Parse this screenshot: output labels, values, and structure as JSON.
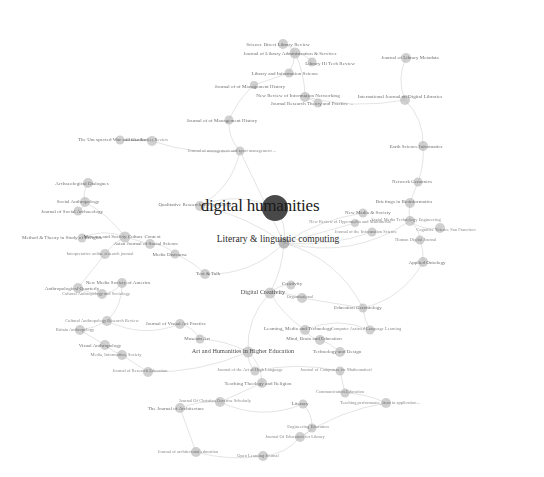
{
  "figure": {
    "title": "digital humanities",
    "type": "network-graph",
    "background_color": "#ffffff",
    "node_color": "#b4b4b4",
    "hub_color": "#3a3a3a",
    "edge_color": "#bdbdbd",
    "label_color": "#555555"
  },
  "chart_data": {
    "type": "scatter",
    "title": "digital humanities",
    "xlabel": "",
    "ylabel": "",
    "grid": false,
    "legend": "none",
    "nodes": [
      {
        "id": "digital-humanities",
        "label": "digital humanities",
        "x": 275,
        "y": 208,
        "r": 13,
        "tier": "hub",
        "size": "hub-label",
        "lx": 260,
        "ly": 205
      },
      {
        "id": "literary-linguistic-computing",
        "label": "Literary & linguistic computing",
        "x": 284,
        "y": 243,
        "r": 5.5,
        "tier": "mid",
        "size": "large",
        "lx": 278,
        "ly": 240
      },
      {
        "id": "n-001",
        "label": "Science Direct Library Review",
        "x": 283,
        "y": 44,
        "r": 5,
        "tier": "",
        "size": "small",
        "lx": 278,
        "ly": 44
      },
      {
        "id": "n-002",
        "label": "Journal of Library Administration & Services",
        "x": 295,
        "y": 53,
        "r": 5.5,
        "tier": "",
        "size": "small",
        "lx": 290,
        "ly": 53
      },
      {
        "id": "n-003",
        "label": "Library Hi Tech Review",
        "x": 312,
        "y": 62,
        "r": 4.5,
        "tier": "",
        "size": "small",
        "lx": 330,
        "ly": 63
      },
      {
        "id": "n-004",
        "label": "Library and Information Science",
        "x": 289,
        "y": 73,
        "r": 4.5,
        "tier": "",
        "size": "small",
        "lx": 285,
        "ly": 73
      },
      {
        "id": "n-005",
        "label": "Journal of of Management History",
        "x": 254,
        "y": 85,
        "r": 4,
        "tier": "",
        "size": "small",
        "lx": 250,
        "ly": 86
      },
      {
        "id": "n-006",
        "label": "New Review of Information Networking",
        "x": 305,
        "y": 97,
        "r": 5,
        "tier": "",
        "size": "small",
        "lx": 298,
        "ly": 95
      },
      {
        "id": "n-007",
        "label": "Journal Research Theory and Practice ...",
        "x": 318,
        "y": 103,
        "r": 4.5,
        "tier": "",
        "size": "small",
        "lx": 312,
        "ly": 103
      },
      {
        "id": "n-008",
        "label": "International Journal on Digital Libraries",
        "x": 405,
        "y": 100,
        "r": 5,
        "tier": "",
        "size": "small",
        "lx": 400,
        "ly": 96
      },
      {
        "id": "n-009",
        "label": "Journal of Library Metadata",
        "x": 406,
        "y": 58,
        "r": 5,
        "tier": "",
        "size": "small",
        "lx": 410,
        "ly": 57
      },
      {
        "id": "n-010",
        "label": "Journal of of Management History",
        "x": 229,
        "y": 120,
        "r": 4.5,
        "tier": "",
        "size": "small",
        "lx": 222,
        "ly": 120
      },
      {
        "id": "n-011",
        "label": "Journal of management and sport management ...",
        "x": 240,
        "y": 151,
        "r": 4.5,
        "tier": "",
        "size": "tiny",
        "lx": 232,
        "ly": 151
      },
      {
        "id": "n-012",
        "label": "The Unexpected War and Gender",
        "x": 120,
        "y": 140,
        "r": 4.5,
        "tier": "",
        "size": "small",
        "lx": 112,
        "ly": 139
      },
      {
        "id": "n-013",
        "label": "Gender Studies Review",
        "x": 152,
        "y": 141,
        "r": 5,
        "tier": "",
        "size": "tiny",
        "lx": 147,
        "ly": 140
      },
      {
        "id": "n-014",
        "label": "Earth Science Informatics",
        "x": 423,
        "y": 146,
        "r": 5,
        "tier": "",
        "size": "small",
        "lx": 416,
        "ly": 146
      },
      {
        "id": "n-015",
        "label": "Network Genomics",
        "x": 418,
        "y": 182,
        "r": 4.5,
        "tier": "",
        "size": "small",
        "lx": 412,
        "ly": 181
      },
      {
        "id": "n-016",
        "label": "Briefings in Bioinformatics",
        "x": 410,
        "y": 203,
        "r": 5,
        "tier": "",
        "size": "small",
        "lx": 404,
        "ly": 201
      },
      {
        "id": "n-017",
        "label": "Archaeological Dialogues",
        "x": 88,
        "y": 183,
        "r": 5,
        "tier": "",
        "size": "small",
        "lx": 82,
        "ly": 183
      },
      {
        "id": "n-018",
        "label": "Social Anthropology",
        "x": 85,
        "y": 202,
        "r": 5,
        "tier": "",
        "size": "small",
        "lx": 78,
        "ly": 201
      },
      {
        "id": "n-019",
        "label": "Journal of Social Archaeology",
        "x": 78,
        "y": 211,
        "r": 4.5,
        "tier": "",
        "size": "small",
        "lx": 72,
        "ly": 211
      },
      {
        "id": "n-020",
        "label": "Qualitative Research in Psychology",
        "x": 200,
        "y": 206,
        "r": 5,
        "tier": "",
        "size": "small",
        "lx": 195,
        "ly": 204
      },
      {
        "id": "n-021",
        "label": "New Media & Society",
        "x": 363,
        "y": 213,
        "r": 4.5,
        "tier": "",
        "size": "small",
        "lx": 368,
        "ly": 212
      },
      {
        "id": "n-022",
        "label": "New Review of Hypermedia and Multimedia",
        "x": 355,
        "y": 223,
        "r": 4,
        "tier": "",
        "size": "tiny",
        "lx": 350,
        "ly": 222
      },
      {
        "id": "n-023",
        "label": "Journal of the Information Science",
        "x": 372,
        "y": 232,
        "r": 4.5,
        "tier": "",
        "size": "tiny",
        "lx": 366,
        "ly": 232
      },
      {
        "id": "n-024",
        "label": "Social Media Technology Engineering",
        "x": 410,
        "y": 221,
        "r": 5,
        "tier": "",
        "size": "tiny",
        "lx": 406,
        "ly": 220
      },
      {
        "id": "n-025",
        "label": "Cognitive Science San Francisco",
        "x": 440,
        "y": 228,
        "r": 5,
        "tier": "",
        "size": "tiny",
        "lx": 446,
        "ly": 230
      },
      {
        "id": "n-026",
        "label": "Human Digital Journal",
        "x": 420,
        "y": 240,
        "r": 4.5,
        "tier": "",
        "size": "tiny",
        "lx": 416,
        "ly": 240
      },
      {
        "id": "n-027",
        "label": "Applied Ontology",
        "x": 423,
        "y": 262,
        "r": 5,
        "tier": "",
        "size": "small",
        "lx": 427,
        "ly": 262
      },
      {
        "id": "n-028",
        "label": "Method & Theory in Study of Religion",
        "x": 82,
        "y": 238,
        "r": 4.5,
        "tier": "",
        "size": "small",
        "lx": 62,
        "ly": 237
      },
      {
        "id": "n-029",
        "label": "Museum and Society Culture Context",
        "x": 125,
        "y": 237,
        "r": 5.5,
        "tier": "",
        "size": "small",
        "lx": 122,
        "ly": 236
      },
      {
        "id": "n-030",
        "label": "Asian Journal of Social Science",
        "x": 150,
        "y": 244,
        "r": 5,
        "tier": "",
        "size": "small",
        "lx": 146,
        "ly": 243
      },
      {
        "id": "n-031",
        "label": "Interpretative online research journal",
        "x": 105,
        "y": 254,
        "r": 5,
        "tier": "",
        "size": "tiny",
        "lx": 100,
        "ly": 254
      },
      {
        "id": "n-032",
        "label": "Media Discourse",
        "x": 175,
        "y": 254,
        "r": 4.5,
        "tier": "",
        "size": "small",
        "lx": 170,
        "ly": 254
      },
      {
        "id": "n-033",
        "label": "Text & Talk",
        "x": 205,
        "y": 274,
        "r": 5,
        "tier": "",
        "size": "small",
        "lx": 208,
        "ly": 273
      },
      {
        "id": "n-034",
        "label": "New Media Society of America",
        "x": 122,
        "y": 283,
        "r": 5,
        "tier": "",
        "size": "small",
        "lx": 118,
        "ly": 282
      },
      {
        "id": "n-035",
        "label": "Anthropological Quarterly",
        "x": 78,
        "y": 288,
        "r": 5,
        "tier": "",
        "size": "small",
        "lx": 72,
        "ly": 288
      },
      {
        "id": "n-036",
        "label": "Cultural Anthropology and Sociology",
        "x": 102,
        "y": 294,
        "r": 5,
        "tier": "",
        "size": "tiny",
        "lx": 96,
        "ly": 294
      },
      {
        "id": "n-037",
        "label": "Digital Creativity",
        "x": 270,
        "y": 293,
        "r": 5.5,
        "tier": "",
        "size": "medium",
        "lx": 263,
        "ly": 292
      },
      {
        "id": "n-038",
        "label": "Creativity",
        "x": 291,
        "y": 285,
        "r": 4.5,
        "tier": "",
        "size": "small",
        "lx": 292,
        "ly": 283
      },
      {
        "id": "n-039",
        "label": "Organisational",
        "x": 302,
        "y": 298,
        "r": 5,
        "tier": "",
        "size": "tiny",
        "lx": 300,
        "ly": 297
      },
      {
        "id": "n-040",
        "label": "Education Gerontology",
        "x": 363,
        "y": 308,
        "r": 4.5,
        "tier": "",
        "size": "small",
        "lx": 358,
        "ly": 307
      },
      {
        "id": "n-041",
        "label": "Cultural Anthropology Research Review",
        "x": 107,
        "y": 321,
        "r": 5,
        "tier": "",
        "size": "tiny",
        "lx": 102,
        "ly": 321
      },
      {
        "id": "n-042",
        "label": "Journal of Visual Art Practice",
        "x": 180,
        "y": 324,
        "r": 5,
        "tier": "",
        "size": "small",
        "lx": 176,
        "ly": 323
      },
      {
        "id": "n-043",
        "label": "Britain Anthropology",
        "x": 80,
        "y": 330,
        "r": 5,
        "tier": "",
        "size": "tiny",
        "lx": 75,
        "ly": 330
      },
      {
        "id": "n-044",
        "label": "Visual Anthropology",
        "x": 105,
        "y": 345,
        "r": 5,
        "tier": "",
        "size": "small",
        "lx": 100,
        "ly": 345
      },
      {
        "id": "n-045",
        "label": "Museum Art",
        "x": 200,
        "y": 339,
        "r": 4.5,
        "tier": "",
        "size": "small",
        "lx": 197,
        "ly": 338
      },
      {
        "id": "n-046",
        "label": "Learning, Media and Technology",
        "x": 305,
        "y": 330,
        "r": 5,
        "tier": "",
        "size": "small",
        "lx": 298,
        "ly": 328
      },
      {
        "id": "n-047",
        "label": "Computer Assisted Language Learning",
        "x": 370,
        "y": 330,
        "r": 4.5,
        "tier": "",
        "size": "tiny",
        "lx": 366,
        "ly": 329
      },
      {
        "id": "n-048",
        "label": "Mind, Brain and Education",
        "x": 320,
        "y": 340,
        "r": 5,
        "tier": "",
        "size": "small",
        "lx": 314,
        "ly": 338
      },
      {
        "id": "n-049",
        "label": "Media, Information, Society",
        "x": 122,
        "y": 355,
        "r": 5,
        "tier": "",
        "size": "tiny",
        "lx": 116,
        "ly": 355
      },
      {
        "id": "n-050",
        "label": "Art and Humanities in Higher Education",
        "x": 248,
        "y": 352,
        "r": 5.5,
        "tier": "",
        "size": "medium",
        "lx": 243,
        "ly": 351
      },
      {
        "id": "n-051",
        "label": "Technology and Design",
        "x": 340,
        "y": 352,
        "r": 5,
        "tier": "",
        "size": "small",
        "lx": 337,
        "ly": 351
      },
      {
        "id": "n-052",
        "label": "Journal of Research Education",
        "x": 148,
        "y": 372,
        "r": 5,
        "tier": "",
        "size": "tiny",
        "lx": 140,
        "ly": 371
      },
      {
        "id": "n-053",
        "label": "Journal of the Art of High Language",
        "x": 255,
        "y": 371,
        "r": 4.5,
        "tier": "",
        "size": "tiny",
        "lx": 250,
        "ly": 370
      },
      {
        "id": "n-054",
        "label": "Journal of Computers for Mathematical",
        "x": 340,
        "y": 371,
        "r": 4.5,
        "tier": "",
        "size": "tiny",
        "lx": 336,
        "ly": 370
      },
      {
        "id": "n-055",
        "label": "Teaching Theology and Religion",
        "x": 262,
        "y": 383,
        "r": 5,
        "tier": "",
        "size": "small",
        "lx": 258,
        "ly": 383
      },
      {
        "id": "n-056",
        "label": "Communication Education",
        "x": 345,
        "y": 393,
        "r": 4.5,
        "tier": "",
        "size": "tiny",
        "lx": 340,
        "ly": 392
      },
      {
        "id": "n-057",
        "label": "Journal Of Christian Doctrine Scholarly",
        "x": 220,
        "y": 402,
        "r": 5,
        "tier": "",
        "size": "tiny",
        "lx": 215,
        "ly": 401
      },
      {
        "id": "n-058",
        "label": "The Journal of Architecture",
        "x": 180,
        "y": 408,
        "r": 5,
        "tier": "",
        "size": "small",
        "lx": 176,
        "ly": 408
      },
      {
        "id": "n-059",
        "label": "Literacy",
        "x": 303,
        "y": 404,
        "r": 4.5,
        "tier": "",
        "size": "small",
        "lx": 300,
        "ly": 403
      },
      {
        "id": "n-060",
        "label": "Teaching performance, trust in application...",
        "x": 386,
        "y": 403,
        "r": 5,
        "tier": "",
        "size": "tiny",
        "lx": 380,
        "ly": 403
      },
      {
        "id": "n-061",
        "label": "Engineering Education",
        "x": 312,
        "y": 428,
        "r": 4.5,
        "tier": "",
        "size": "tiny",
        "lx": 308,
        "ly": 427
      },
      {
        "id": "n-062",
        "label": "Journal Of Education for Library",
        "x": 300,
        "y": 437,
        "r": 5,
        "tier": "",
        "size": "tiny",
        "lx": 295,
        "ly": 437
      },
      {
        "id": "n-063",
        "label": "Journal of architectural education",
        "x": 196,
        "y": 452,
        "r": 5,
        "tier": "",
        "size": "tiny",
        "lx": 188,
        "ly": 452
      },
      {
        "id": "n-064",
        "label": "Open Learning Journal",
        "x": 263,
        "y": 456,
        "r": 5,
        "tier": "",
        "size": "tiny",
        "lx": 258,
        "ly": 456
      }
    ],
    "edges": [
      [
        "digital-humanities",
        "literary-linguistic-computing"
      ],
      [
        "literary-linguistic-computing",
        "n-021"
      ],
      [
        "literary-linguistic-computing",
        "n-022"
      ],
      [
        "literary-linguistic-computing",
        "n-023"
      ],
      [
        "literary-linguistic-computing",
        "n-024"
      ],
      [
        "literary-linguistic-computing",
        "n-033"
      ],
      [
        "literary-linguistic-computing",
        "n-037"
      ],
      [
        "literary-linguistic-computing",
        "n-011"
      ],
      [
        "literary-linguistic-computing",
        "n-020"
      ],
      [
        "n-020",
        "n-011"
      ],
      [
        "n-011",
        "n-010"
      ],
      [
        "n-010",
        "n-005"
      ],
      [
        "n-005",
        "n-004"
      ],
      [
        "n-004",
        "n-002"
      ],
      [
        "n-002",
        "n-001"
      ],
      [
        "n-002",
        "n-003"
      ],
      [
        "n-002",
        "n-006"
      ],
      [
        "n-006",
        "n-007"
      ],
      [
        "n-006",
        "n-008"
      ],
      [
        "n-009",
        "n-008"
      ],
      [
        "n-008",
        "n-014"
      ],
      [
        "n-014",
        "n-015"
      ],
      [
        "n-015",
        "n-016"
      ],
      [
        "n-016",
        "n-024"
      ],
      [
        "n-024",
        "n-025"
      ],
      [
        "n-024",
        "n-026"
      ],
      [
        "n-026",
        "n-027"
      ],
      [
        "n-012",
        "n-013"
      ],
      [
        "n-013",
        "n-011"
      ],
      [
        "n-017",
        "n-018"
      ],
      [
        "n-018",
        "n-019"
      ],
      [
        "n-018",
        "n-029"
      ],
      [
        "n-029",
        "n-030"
      ],
      [
        "n-029",
        "n-031"
      ],
      [
        "n-029",
        "n-028"
      ],
      [
        "n-030",
        "n-032"
      ],
      [
        "n-032",
        "n-033"
      ],
      [
        "n-031",
        "n-035"
      ],
      [
        "n-035",
        "n-036"
      ],
      [
        "n-036",
        "n-034"
      ],
      [
        "n-034",
        "n-041"
      ],
      [
        "n-041",
        "n-043"
      ],
      [
        "n-043",
        "n-044"
      ],
      [
        "n-044",
        "n-049"
      ],
      [
        "n-041",
        "n-042"
      ],
      [
        "n-042",
        "n-045"
      ],
      [
        "n-045",
        "n-050"
      ],
      [
        "n-049",
        "n-052"
      ],
      [
        "n-052",
        "n-050"
      ],
      [
        "n-050",
        "n-053"
      ],
      [
        "n-050",
        "n-055"
      ],
      [
        "n-053",
        "n-054"
      ],
      [
        "n-055",
        "n-057"
      ],
      [
        "n-057",
        "n-058"
      ],
      [
        "n-057",
        "n-059"
      ],
      [
        "n-059",
        "n-061"
      ],
      [
        "n-061",
        "n-062"
      ],
      [
        "n-058",
        "n-063"
      ],
      [
        "n-063",
        "n-064"
      ],
      [
        "n-064",
        "n-062"
      ],
      [
        "n-037",
        "n-038"
      ],
      [
        "n-037",
        "n-039"
      ],
      [
        "n-039",
        "n-040"
      ],
      [
        "n-040",
        "n-047"
      ],
      [
        "n-046",
        "n-048"
      ],
      [
        "n-046",
        "n-047"
      ],
      [
        "n-048",
        "n-051"
      ],
      [
        "n-051",
        "n-054"
      ],
      [
        "n-037",
        "n-046"
      ],
      [
        "n-037",
        "n-050"
      ],
      [
        "n-027",
        "n-040"
      ],
      [
        "n-056",
        "n-060"
      ],
      [
        "n-054",
        "n-056"
      ],
      [
        "n-060",
        "n-062"
      ],
      [
        "digital-humanities",
        "n-020"
      ],
      [
        "literary-linguistic-computing",
        "n-040"
      ]
    ]
  }
}
